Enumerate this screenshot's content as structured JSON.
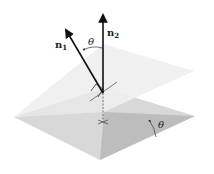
{
  "figure": {
    "labels": {
      "n1": {
        "base": "n",
        "sub": "1"
      },
      "n2": {
        "base": "n",
        "sub": "2"
      },
      "theta_normals": "θ",
      "theta_planes": "θ"
    },
    "colors": {
      "upper_plane": "#eeeeee",
      "lower_plane_front": "#d6d6d6",
      "lower_plane_right": "#b9b9b9",
      "vector": "#111111",
      "text": "#222222"
    }
  }
}
